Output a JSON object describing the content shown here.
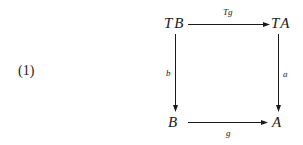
{
  "equation_number": "(1)",
  "nodes": {
    "top_left": "TB",
    "top_right": "TA",
    "bottom_left": "B",
    "bottom_right": "A"
  },
  "arrows": {
    "top": {
      "from": "TB",
      "to": "TA",
      "label": "Tg"
    },
    "left": {
      "from": "TB",
      "to": "B",
      "label": "b"
    },
    "right": {
      "from": "TA",
      "to": "A",
      "label": "a"
    },
    "bottom": {
      "from": "B",
      "to": "A",
      "label": "g"
    }
  },
  "colors": {
    "ink": "#1a1a1a",
    "background": "#ffffff"
  }
}
